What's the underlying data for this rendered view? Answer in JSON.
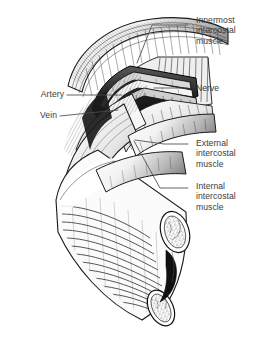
{
  "figure": {
    "style": "pen-and-ink stipple and hatch line art",
    "background_color": "#ffffff",
    "ink_color": "#1a1a1a",
    "text_color": "#3a3a3a",
    "leader_color": "#4a4a4a"
  },
  "labels": {
    "innermost": {
      "text": "Innermost\nintercostal\nmuscle",
      "side": "right",
      "x": 196,
      "y": 15
    },
    "nerve": {
      "text": "Nerve",
      "side": "right",
      "x": 196,
      "y": 83
    },
    "external": {
      "text": "External\nintercostal\nmuscle",
      "side": "right",
      "x": 196,
      "y": 138
    },
    "internal": {
      "text": "Internal\nintercostal\nmuscle",
      "side": "right",
      "x": 196,
      "y": 181
    },
    "artery": {
      "text": "Artery",
      "side": "left",
      "x": 18,
      "y": 89
    },
    "vein": {
      "text": "Vein",
      "side": "left",
      "x": 18,
      "y": 110
    }
  },
  "structures": [
    {
      "name": "rib-upper",
      "description": "upper cut rib with periosteum"
    },
    {
      "name": "rib-lower",
      "description": "lower cut rib with cancellous bone"
    },
    {
      "name": "external-intercostal-muscle",
      "description": "outer oblique fiber layer"
    },
    {
      "name": "internal-intercostal-muscle",
      "description": "middle oblique fiber layer"
    },
    {
      "name": "innermost-intercostal-muscle",
      "description": "deepest fiber layer"
    },
    {
      "name": "intercostal-vein",
      "description": "superior vessel in costal groove"
    },
    {
      "name": "intercostal-artery",
      "description": "middle vessel in costal groove"
    },
    {
      "name": "intercostal-nerve",
      "description": "inferior element of bundle"
    }
  ]
}
